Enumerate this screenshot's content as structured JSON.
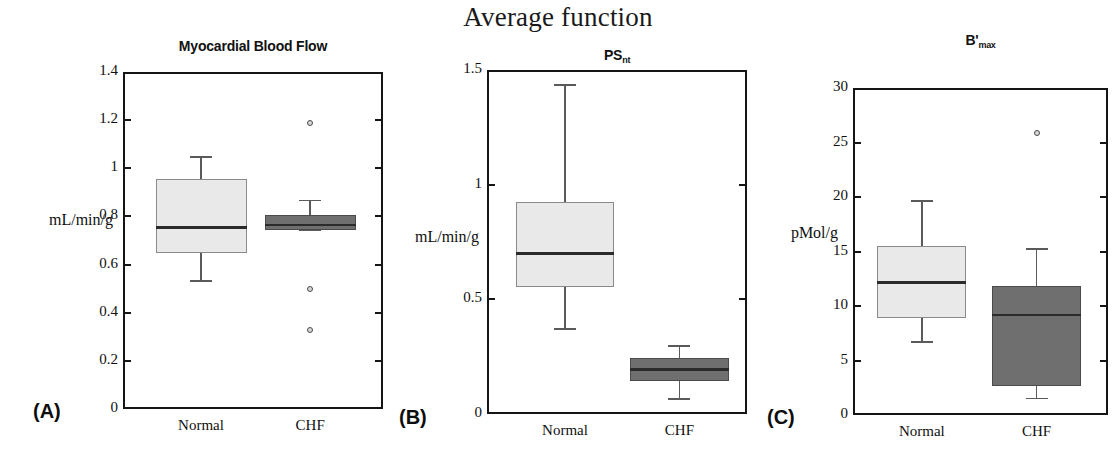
{
  "figure": {
    "title": "Average function",
    "groups": [
      "Normal",
      "CHF"
    ]
  },
  "panels": [
    {
      "letter": "(A)",
      "title_main": "Myocardial Blood Flow",
      "title_sub": "",
      "ylabel": "mL/min/g",
      "yticks": [
        "1.4",
        "1.2",
        "1",
        "0.8",
        "0.6",
        "0.4",
        "0.2",
        "0"
      ],
      "xticks": [
        "Normal",
        "CHF"
      ]
    },
    {
      "letter": "(B)",
      "title_main": "PS",
      "title_sub": "nt",
      "ylabel": "mL/min/g",
      "yticks": [
        "1.5",
        "1",
        "0.5",
        "0"
      ],
      "xticks": [
        "Normal",
        "CHF"
      ]
    },
    {
      "letter": "(C)",
      "title_main": "B'",
      "title_sub": "max",
      "ylabel": "pMol/g",
      "yticks": [
        "30",
        "25",
        "20",
        "15",
        "10",
        "5",
        "0"
      ],
      "xticks": [
        "Normal",
        "CHF"
      ]
    }
  ],
  "colors": {
    "normal_fill": "#e9e9e9",
    "chf_fill": "#6f6f6f",
    "axis": "#151515",
    "median": "#2b2b2b",
    "outlier_edge": "#4a4a4a"
  },
  "chart_data": [
    {
      "type": "box",
      "panel": "(A)",
      "title": "Myocardial Blood Flow",
      "xlabel": "",
      "ylabel": "mL/min/g",
      "ylim": [
        0,
        1.4
      ],
      "yticks": [
        0,
        0.2,
        0.4,
        0.6,
        0.8,
        1.0,
        1.2,
        1.4
      ],
      "grid": false,
      "legend": "none",
      "categories": [
        "Normal",
        "CHF"
      ],
      "boxes": [
        {
          "name": "Normal",
          "fill": "#e9e9e9",
          "whisker_low": 0.535,
          "q1": 0.65,
          "median": 0.755,
          "q3": 0.955,
          "whisker_high": 1.05,
          "outliers": []
        },
        {
          "name": "CHF",
          "fill": "#6f6f6f",
          "whisker_low": 0.745,
          "q1": 0.745,
          "median": 0.765,
          "q3": 0.805,
          "whisker_high": 0.87,
          "outliers": [
            1.19,
            0.5,
            0.33
          ]
        }
      ]
    },
    {
      "type": "box",
      "panel": "(B)",
      "title": "PSnt",
      "xlabel": "",
      "ylabel": "mL/min/g",
      "ylim": [
        0,
        1.5
      ],
      "yticks": [
        0,
        0.5,
        1.0,
        1.5
      ],
      "grid": false,
      "legend": "none",
      "categories": [
        "Normal",
        "CHF"
      ],
      "boxes": [
        {
          "name": "Normal",
          "fill": "#e9e9e9",
          "whisker_low": 0.375,
          "q1": 0.555,
          "median": 0.7,
          "q3": 0.925,
          "whisker_high": 1.44,
          "outliers": []
        },
        {
          "name": "CHF",
          "fill": "#6f6f6f",
          "whisker_low": 0.07,
          "q1": 0.145,
          "median": 0.195,
          "q3": 0.245,
          "whisker_high": 0.3,
          "outliers": []
        }
      ]
    },
    {
      "type": "box",
      "panel": "(C)",
      "title": "B'max",
      "xlabel": "",
      "ylabel": "pMol/g",
      "ylim": [
        0,
        30
      ],
      "yticks": [
        0,
        5,
        10,
        15,
        20,
        25,
        30
      ],
      "grid": false,
      "legend": "none",
      "categories": [
        "Normal",
        "CHF"
      ],
      "boxes": [
        {
          "name": "Normal",
          "fill": "#e9e9e9",
          "whisker_low": 6.8,
          "q1": 8.9,
          "median": 12.2,
          "q3": 15.5,
          "whisker_high": 19.7,
          "outliers": []
        },
        {
          "name": "CHF",
          "fill": "#6f6f6f",
          "whisker_low": 1.6,
          "q1": 2.7,
          "median": 9.2,
          "q3": 11.8,
          "whisker_high": 15.3,
          "outliers": [
            25.9
          ]
        }
      ]
    }
  ]
}
